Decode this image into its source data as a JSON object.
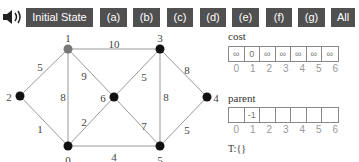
{
  "toolbar": {
    "speaker_icon": "speaker-icon",
    "buttons": [
      {
        "label": "Initial State",
        "x": 26,
        "w": 67
      },
      {
        "label": "(a)",
        "x": 100,
        "w": 27
      },
      {
        "label": "(b)",
        "x": 133,
        "w": 27
      },
      {
        "label": "(c)",
        "x": 167,
        "w": 26
      },
      {
        "label": "(d)",
        "x": 200,
        "w": 26
      },
      {
        "label": "(e)",
        "x": 232,
        "w": 27
      },
      {
        "label": "(f)",
        "x": 266,
        "w": 26
      },
      {
        "label": "(g)",
        "x": 298,
        "w": 27
      },
      {
        "label": "All",
        "x": 331,
        "w": 24
      }
    ]
  },
  "graph": {
    "nodes": [
      {
        "id": "0",
        "x": 68,
        "y": 146,
        "color": "#111111",
        "lx": 68,
        "ly": 160
      },
      {
        "id": "1",
        "x": 68,
        "y": 49,
        "color": "#777777",
        "lx": 68,
        "ly": 38
      },
      {
        "id": "2",
        "x": 20,
        "y": 96,
        "color": "#111111",
        "lx": 9,
        "ly": 97
      },
      {
        "id": "3",
        "x": 160,
        "y": 49,
        "color": "#111111",
        "lx": 160,
        "ly": 38
      },
      {
        "id": "4",
        "x": 207,
        "y": 97,
        "color": "#111111",
        "lx": 216,
        "ly": 98
      },
      {
        "id": "5",
        "x": 160,
        "y": 146,
        "color": "#111111",
        "lx": 160,
        "ly": 160
      },
      {
        "id": "6",
        "x": 114,
        "y": 97,
        "color": "#111111",
        "lx": 103,
        "ly": 98
      }
    ],
    "edges": [
      {
        "from": "1",
        "to": "2",
        "weight": "5",
        "lx": 40,
        "ly": 67
      },
      {
        "from": "2",
        "to": "0",
        "weight": "1",
        "lx": 40,
        "ly": 129
      },
      {
        "from": "1",
        "to": "0",
        "weight": "8",
        "lx": 63,
        "ly": 97
      },
      {
        "from": "1",
        "to": "6",
        "weight": "9",
        "lx": 84,
        "ly": 76
      },
      {
        "from": "0",
        "to": "6",
        "weight": "2",
        "lx": 84,
        "ly": 122
      },
      {
        "from": "1",
        "to": "3",
        "weight": "10",
        "lx": 114,
        "ly": 44
      },
      {
        "from": "0",
        "to": "5",
        "weight": "4",
        "lx": 114,
        "ly": 157
      },
      {
        "from": "6",
        "to": "3",
        "weight": "5",
        "lx": 144,
        "ly": 77
      },
      {
        "from": "6",
        "to": "5",
        "weight": "7",
        "lx": 144,
        "ly": 126
      },
      {
        "from": "3",
        "to": "5",
        "weight": "8",
        "lx": 166,
        "ly": 97
      },
      {
        "from": "3",
        "to": "4",
        "weight": "8",
        "lx": 187,
        "ly": 70
      },
      {
        "from": "5",
        "to": "4",
        "weight": "5",
        "lx": 187,
        "ly": 130
      }
    ]
  },
  "cost": {
    "title": "cost",
    "values": [
      "∞",
      "0",
      "∞",
      "∞",
      "∞",
      "∞",
      "∞"
    ],
    "indices": [
      "0",
      "1",
      "2",
      "3",
      "4",
      "5",
      "6"
    ]
  },
  "parent": {
    "title": "parent",
    "values": [
      "",
      "-1",
      "",
      "",
      "",
      "",
      ""
    ],
    "indices": [
      "0",
      "1",
      "2",
      "3",
      "4",
      "5",
      "6"
    ]
  },
  "tree_set": "T:{}"
}
